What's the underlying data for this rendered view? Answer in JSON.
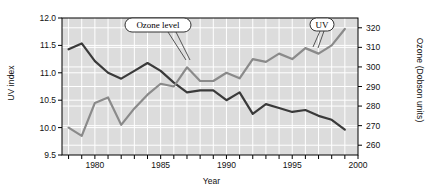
{
  "chart_data": {
    "type": "line",
    "title": "",
    "xlabel": "Year",
    "ylabel": "UV index",
    "ylabel_right": "Ozone (Dobson units)",
    "xlim": [
      1977.5,
      2000
    ],
    "ylim": [
      9.5,
      12.0
    ],
    "ylim_right": [
      255,
      325
    ],
    "grid": true,
    "legend": "annotations",
    "x_ticks_major": [
      "1980",
      "1985",
      "1990",
      "1995",
      "2000"
    ],
    "x_ticks_major_values": [
      1980,
      1985,
      1990,
      1995,
      2000
    ],
    "x_ticks_minor_values": [
      1978,
      1979,
      1981,
      1982,
      1983,
      1984,
      1986,
      1987,
      1988,
      1989,
      1991,
      1992,
      1993,
      1994,
      1996,
      1997,
      1998,
      1999
    ],
    "y_ticks_left": [
      "9.5",
      "10.0",
      "10.5",
      "11.0",
      "11.5",
      "12.0"
    ],
    "y_ticks_left_values": [
      9.5,
      10.0,
      10.5,
      11.0,
      11.5,
      12.0
    ],
    "y_ticks_right": [
      "260",
      "270",
      "280",
      "290",
      "300",
      "310",
      "320"
    ],
    "y_ticks_right_values": [
      260,
      270,
      280,
      290,
      300,
      310,
      320
    ],
    "annotations": [
      {
        "text": "Ozone level",
        "target_series": "Ozone level"
      },
      {
        "text": "UV",
        "target_series": "UV index"
      }
    ],
    "x": [
      1978,
      1979,
      1980,
      1981,
      1982,
      1983,
      1984,
      1985,
      1986,
      1987,
      1988,
      1989,
      1990,
      1991,
      1992,
      1993,
      1994,
      1995,
      1996,
      1997,
      1998,
      1999
    ],
    "series": [
      {
        "name": "Ozone level",
        "axis": "right",
        "units": "Dobson units",
        "color": "#3a3a3a",
        "values": [
          309,
          312,
          303,
          297,
          294,
          298,
          302,
          298,
          292,
          287,
          288,
          288,
          283,
          287,
          276,
          281,
          279,
          277,
          278,
          275,
          273,
          268
        ]
      },
      {
        "name": "UV index",
        "axis": "left",
        "units": "UV index",
        "color": "#8a8a8a",
        "values": [
          10.0,
          9.85,
          10.45,
          10.55,
          10.05,
          10.35,
          10.6,
          10.8,
          10.75,
          11.1,
          10.85,
          10.85,
          11.0,
          10.9,
          11.25,
          11.2,
          11.35,
          11.25,
          11.45,
          11.35,
          11.5,
          11.8
        ]
      }
    ]
  },
  "plot": {
    "bg_color": "#dcdcdc",
    "grid_color": "#ffffff",
    "axis_color": "#000000"
  }
}
